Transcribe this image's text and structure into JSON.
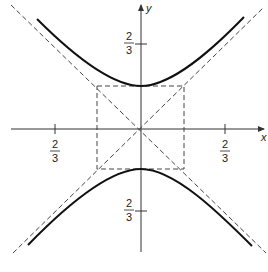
{
  "diagram": {
    "type": "hyperbola",
    "equation_form": "y^2/b^2 - x^2/a^2 = 1",
    "axes": {
      "x_label": "x",
      "y_label": "y"
    },
    "tick_labels": {
      "x_negative": {
        "num": "2",
        "den": "3"
      },
      "x_positive": {
        "num": "2",
        "den": "3"
      },
      "y_positive": {
        "num": "2",
        "den": "3"
      },
      "y_negative": {
        "num": "2",
        "den": "3"
      }
    },
    "colors": {
      "curve": "#111111",
      "axis": "#333333",
      "dashed": "#444444"
    }
  }
}
